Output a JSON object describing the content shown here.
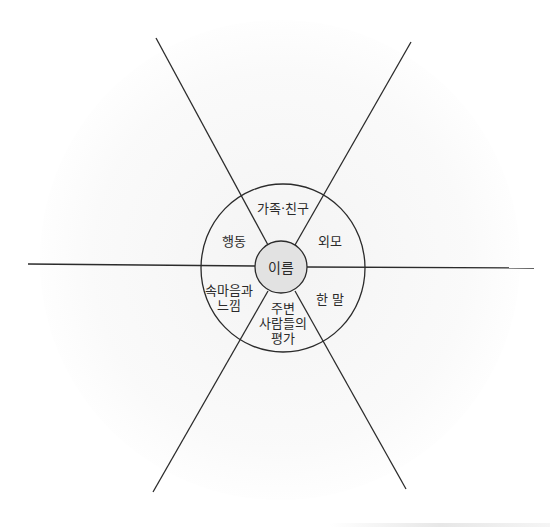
{
  "diagram": {
    "type": "character-web",
    "center": {
      "label": "이름",
      "fill": "#e2e2e2"
    },
    "segments": [
      {
        "id": "family-friends",
        "lines": [
          "가족·친구"
        ]
      },
      {
        "id": "appearance",
        "lines": [
          "외모"
        ]
      },
      {
        "id": "behavior",
        "lines": [
          "행동"
        ]
      },
      {
        "id": "inner-thoughts",
        "lines": [
          "속마음과",
          "느낌"
        ]
      },
      {
        "id": "words-spoken",
        "lines": [
          "한 말"
        ]
      },
      {
        "id": "others-evaluation",
        "lines": [
          "주변",
          "사람들의",
          "평가"
        ]
      }
    ],
    "colors": {
      "line": "#2b2b2b",
      "text": "#2a2a2a",
      "center_fill": "#e2e2e2",
      "background": "#ffffff"
    }
  }
}
